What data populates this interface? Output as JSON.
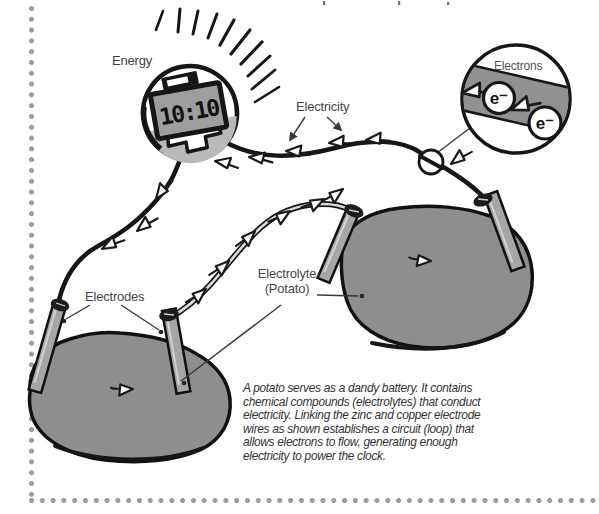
{
  "figure": {
    "labels": {
      "energy": "Energy",
      "electricity": "Electricity",
      "electrons": "Electrons",
      "electrodes": "Electrodes",
      "electrolyte": [
        "Electrolyte",
        "(Potato)"
      ],
      "clock_time": "10:10",
      "electron_symbol": "e⁻"
    },
    "caption": "A potato serves as a dandy battery. It contains chemical compounds (electrolytes) that conduct electricity. Linking the zinc and copper electrode wires as shown establishes a circuit (loop) that allows electrons to flow, generating enough electricity to power the clock.",
    "colors": {
      "potato_gray": "#8e8e8e",
      "ink": "#1a1a1a",
      "label_gray": "#474747",
      "dot_border_gray": "#9c9c9c",
      "clock_body_gray": "#b9b9b9",
      "display_gray": "#9e9e9e",
      "magnifier_band_gray": "#919191",
      "wire_light_gray": "#dcdcdc"
    }
  }
}
